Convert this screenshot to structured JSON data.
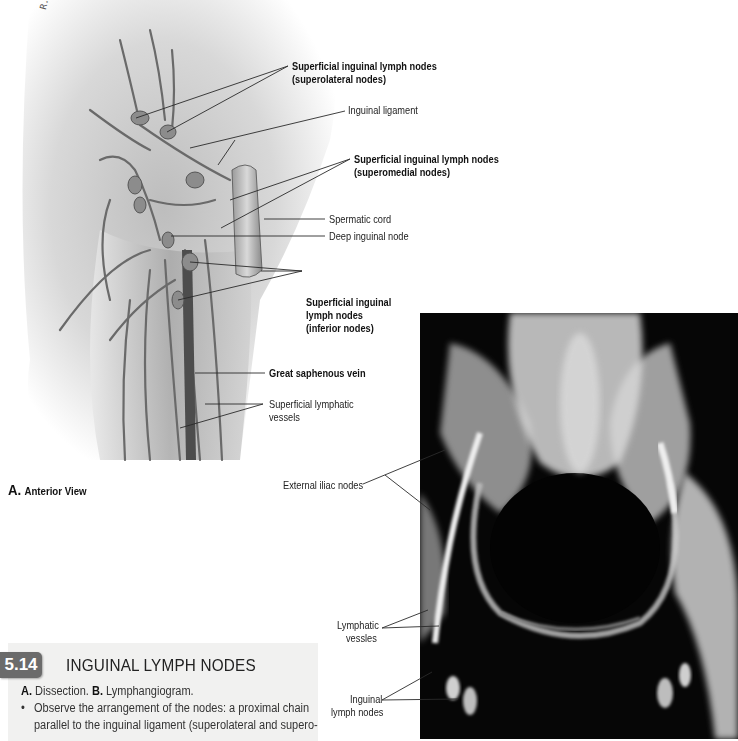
{
  "figure": {
    "number": "5.14",
    "title": "INGUINAL LYMPH NODES",
    "caption": {
      "line1_a_label": "A.",
      "line1_a_text": "Dissection.",
      "line1_b_label": "B.",
      "line1_b_text": "Lymphangiogram.",
      "bullet": "•",
      "bullet_line1": "Observe the arrangement of the nodes: a proximal chain",
      "bullet_line2": "parallel to the inguinal ligament (superolateral and supero-"
    },
    "badge_color": "#6b6b6b",
    "caption_bg": "#f1f1f0"
  },
  "panel_a": {
    "letter": "A.",
    "view": "Anterior View",
    "signature": "R.M. AFTER D. CHUAB",
    "labels": {
      "superolateral_1": "Superficial inguinal lymph nodes",
      "superolateral_2": "(superolateral nodes)",
      "inguinal_ligament": "Inguinal ligament",
      "superomedial_1": "Superficial inguinal lymph nodes",
      "superomedial_2": "(superomedial nodes)",
      "spermatic_cord": "Spermatic cord",
      "deep_inguinal_node": "Deep inguinal node",
      "inferior_1": "Superficial inguinal",
      "inferior_2": "lymph nodes",
      "inferior_3": "(inferior nodes)",
      "great_saphenous_vein": "Great saphenous vein",
      "superficial_lymphatic_1": "Superficial lymphatic",
      "superficial_lymphatic_2": "vessels"
    }
  },
  "panel_b": {
    "labels": {
      "external_iliac_nodes": "External iliac nodes",
      "lymphatic_vessels_1": "Lymphatic",
      "lymphatic_vessels_2": "vessles",
      "inguinal_lymph_nodes_1": "Inguinal",
      "inguinal_lymph_nodes_2": "lymph nodes"
    }
  }
}
